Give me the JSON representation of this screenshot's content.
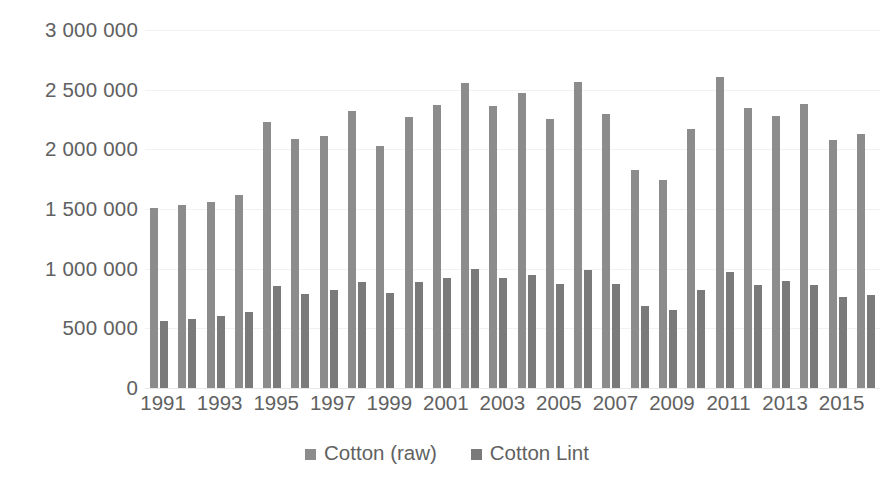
{
  "chart_data": {
    "type": "bar",
    "title": "",
    "subtitle": "",
    "xlabel": "",
    "ylabel": "",
    "ylim": [
      0,
      3000000
    ],
    "ytick_step": 500000,
    "grid": true,
    "legend_position": "bottom",
    "ytick_labels": [
      "3 000 000",
      "2 500 000",
      "2 000 000",
      "1 500 000",
      "1 000 000",
      "500 000",
      "0"
    ],
    "ytick_values": [
      3000000,
      2500000,
      2000000,
      1500000,
      1000000,
      500000,
      0
    ],
    "categories": [
      "1991",
      "1992",
      "1993",
      "1994",
      "1995",
      "1996",
      "1997",
      "1998",
      "1999",
      "2000",
      "2001",
      "2002",
      "2003",
      "2004",
      "2005",
      "2006",
      "2007",
      "2008",
      "2009",
      "2010",
      "2011",
      "2012",
      "2013",
      "2014",
      "2015",
      "2016"
    ],
    "xtick_labels_shown": [
      "1991",
      "1993",
      "1995",
      "1997",
      "1999",
      "2001",
      "2003",
      "2005",
      "2007",
      "2009",
      "2011",
      "2013",
      "2015"
    ],
    "series": [
      {
        "name": "Cotton (raw)",
        "color": "#8c8c8c",
        "values": [
          1510000,
          1535000,
          1560000,
          1620000,
          2230000,
          2085000,
          2110000,
          2320000,
          2030000,
          2275000,
          2370000,
          2555000,
          2360000,
          2470000,
          2255000,
          2565000,
          2300000,
          1830000,
          1745000,
          2170000,
          2605000,
          2345000,
          2280000,
          2380000,
          2075000,
          2125000
        ]
      },
      {
        "name": "Cotton Lint",
        "color": "#7a7a7a",
        "values": [
          565000,
          575000,
          600000,
          635000,
          855000,
          790000,
          825000,
          885000,
          800000,
          890000,
          920000,
          1000000,
          925000,
          945000,
          870000,
          985000,
          870000,
          685000,
          655000,
          825000,
          970000,
          865000,
          895000,
          865000,
          760000,
          780000
        ]
      }
    ]
  },
  "legend": {
    "items": [
      {
        "label": "Cotton (raw)",
        "swatch": "legend-swatch-cotton-raw"
      },
      {
        "label": "Cotton Lint",
        "swatch": "legend-swatch-cotton-lint"
      }
    ]
  }
}
